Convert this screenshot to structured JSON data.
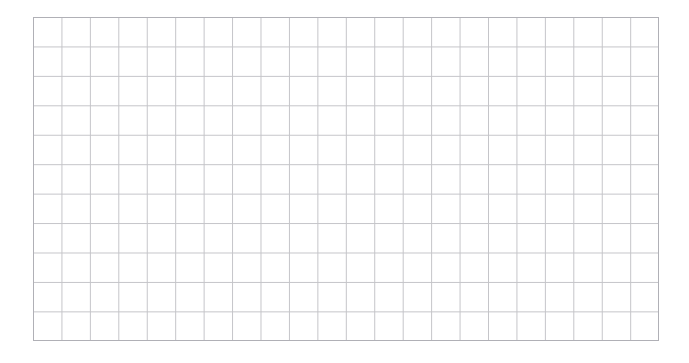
{
  "page": {
    "kind": "blank-grid-sheet",
    "width": 689,
    "height": 363,
    "background_color": "#ffffff",
    "title": "",
    "subtitle": "",
    "footer": ""
  },
  "chart_data": {
    "type": "table",
    "title": "",
    "subtitle": "",
    "xlabel": "",
    "ylabel": "",
    "categories": [],
    "values": [],
    "series": [],
    "annotations": [],
    "legend": {
      "entries": [],
      "position": "none"
    },
    "grid": {
      "visible": true,
      "columns": 22,
      "rows": 11,
      "cell_width": 28.45,
      "cell_height": 29.45,
      "line_color": "#c4c4c8",
      "line_width": 1,
      "border_color": "#b0b0b6",
      "border_width": 1,
      "plot_left": 33,
      "plot_top": 17,
      "plot_right": 659,
      "plot_bottom": 341,
      "plot_width": 626,
      "plot_height": 324
    },
    "axes": {
      "x_ticks": [],
      "y_ticks": [],
      "x_tick_labels": [],
      "y_tick_labels": [],
      "xlim": [
        0,
        22
      ],
      "ylim": [
        0,
        11
      ],
      "visible_spines": false
    }
  }
}
